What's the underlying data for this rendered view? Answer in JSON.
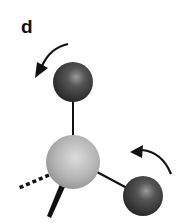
{
  "figure": {
    "panel_label": "d",
    "atoms": [
      {
        "name": "top-atom",
        "color": "#3a3a3a",
        "cx": 73,
        "cy": 82,
        "r": 20
      },
      {
        "name": "central-atom",
        "color": "#b5b5b5",
        "cx": 73,
        "cy": 162,
        "r": 27
      },
      {
        "name": "right-atom",
        "color": "#3a3a3a",
        "cx": 143,
        "cy": 196,
        "r": 20
      }
    ],
    "bonds": [
      {
        "name": "bond-top",
        "style": "solid"
      },
      {
        "name": "bond-right",
        "style": "solid"
      },
      {
        "name": "bond-dashed",
        "style": "dashed"
      },
      {
        "name": "bond-wedge",
        "style": "wedge"
      }
    ],
    "arrows": [
      {
        "name": "rotation-arrow-top",
        "direction": "counterclockwise"
      },
      {
        "name": "rotation-arrow-right",
        "direction": "counterclockwise"
      }
    ]
  }
}
